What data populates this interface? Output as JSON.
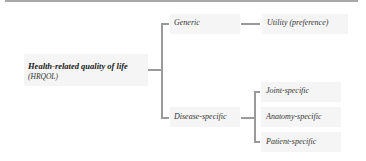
{
  "diagram": {
    "type": "tree",
    "root": {
      "title": "Health-related quality of life",
      "abbreviation": "(HRQOL)"
    },
    "branches": [
      {
        "label": "Generic",
        "children": [
          {
            "label": "Utility (preference)"
          }
        ]
      },
      {
        "label": "Disease-specific",
        "children": [
          {
            "label": "Joint-specific"
          },
          {
            "label": "Anatomy-specific"
          },
          {
            "label": "Patient-specific"
          }
        ]
      }
    ],
    "colors": {
      "box_fill": "#f5f5f5",
      "connector": "#9a9a9a",
      "top_rule": "#a8a8a8"
    }
  }
}
